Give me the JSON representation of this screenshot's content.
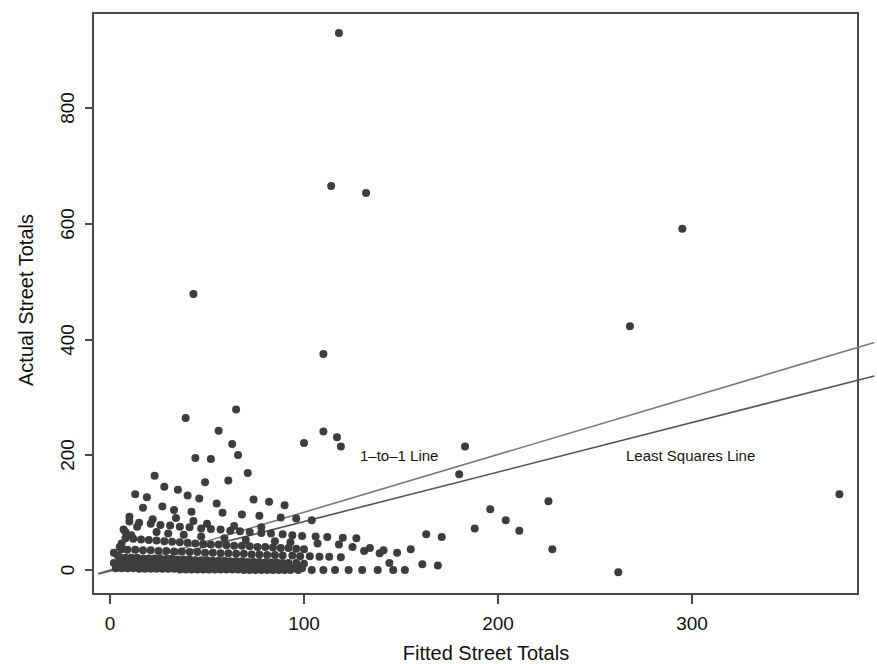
{
  "figure": {
    "title": "",
    "background_color": "#ffffff",
    "point_color": "#3d3d3d",
    "frame_color": "#4a4a4a"
  },
  "axes": {
    "x_title": "Fitted Street Totals",
    "y_title": "Actual Street Totals",
    "x_ticks": [
      "0",
      "100",
      "200",
      "300"
    ],
    "y_ticks": [
      "0",
      "200",
      "400",
      "600",
      "800"
    ]
  },
  "annotations": [
    {
      "id": "one-to-one",
      "label": "1–to–1 Line",
      "x_px": 360,
      "y_px": 461
    },
    {
      "id": "least-squares",
      "label": "Least Squares Line",
      "x_px": 626,
      "y_px": 461
    }
  ],
  "chart_data": {
    "type": "scatter",
    "title": "",
    "xlabel": "Fitted Street Totals",
    "ylabel": "Actual Street Totals",
    "xlim": [
      -7,
      395
    ],
    "ylim": [
      -40,
      975
    ],
    "x_ticks": [
      0,
      100,
      200,
      300
    ],
    "y_ticks": [
      0,
      200,
      400,
      600,
      800
    ],
    "grid": false,
    "legend": "none",
    "marker_color": "#3d3d3d",
    "marker_size_px": 8,
    "series": [
      {
        "name": "Streets",
        "type": "scatter",
        "points": [
          [
            118,
            930
          ],
          [
            114,
            665
          ],
          [
            132,
            653
          ],
          [
            295,
            591
          ],
          [
            43,
            478
          ],
          [
            268,
            422
          ],
          [
            110,
            374
          ],
          [
            65,
            278
          ],
          [
            39,
            263
          ],
          [
            110,
            240
          ],
          [
            100,
            220
          ],
          [
            117,
            230
          ],
          [
            56,
            241
          ],
          [
            63,
            218
          ],
          [
            119,
            214
          ],
          [
            44,
            194
          ],
          [
            52,
            192
          ],
          [
            66,
            199
          ],
          [
            180,
            166
          ],
          [
            376,
            131
          ],
          [
            71,
            168
          ],
          [
            23,
            163
          ],
          [
            61,
            155
          ],
          [
            49,
            152
          ],
          [
            183,
            214
          ],
          [
            196,
            105
          ],
          [
            204,
            86
          ],
          [
            226,
            119
          ],
          [
            28,
            144
          ],
          [
            35,
            139
          ],
          [
            13,
            131
          ],
          [
            40,
            129
          ],
          [
            19,
            126
          ],
          [
            46,
            124
          ],
          [
            74,
            122
          ],
          [
            82,
            118
          ],
          [
            90,
            112
          ],
          [
            55,
            115
          ],
          [
            27,
            110
          ],
          [
            17,
            108
          ],
          [
            33,
            104
          ],
          [
            42,
            101
          ],
          [
            58,
            99
          ],
          [
            68,
            96
          ],
          [
            77,
            94
          ],
          [
            88,
            91
          ],
          [
            96,
            89
          ],
          [
            104,
            86
          ],
          [
            10,
            84
          ],
          [
            15,
            82
          ],
          [
            21,
            80
          ],
          [
            26,
            78
          ],
          [
            31,
            77
          ],
          [
            36,
            75
          ],
          [
            41,
            74
          ],
          [
            47,
            72
          ],
          [
            52,
            71
          ],
          [
            57,
            70
          ],
          [
            62,
            68
          ],
          [
            67,
            67
          ],
          [
            72,
            66
          ],
          [
            78,
            64
          ],
          [
            83,
            63
          ],
          [
            89,
            62
          ],
          [
            94,
            60
          ],
          [
            99,
            59
          ],
          [
            106,
            58
          ],
          [
            112,
            57
          ],
          [
            120,
            56
          ],
          [
            127,
            55
          ],
          [
            134,
            38
          ],
          [
            141,
            34
          ],
          [
            148,
            30
          ],
          [
            155,
            36
          ],
          [
            163,
            62
          ],
          [
            171,
            57
          ],
          [
            8,
            55
          ],
          [
            12,
            54
          ],
          [
            16,
            53
          ],
          [
            20,
            52
          ],
          [
            24,
            51
          ],
          [
            28,
            50
          ],
          [
            32,
            49
          ],
          [
            36,
            48
          ],
          [
            40,
            47
          ],
          [
            44,
            46
          ],
          [
            48,
            45
          ],
          [
            52,
            44
          ],
          [
            56,
            44
          ],
          [
            60,
            43
          ],
          [
            64,
            42
          ],
          [
            68,
            42
          ],
          [
            72,
            41
          ],
          [
            76,
            40
          ],
          [
            80,
            40
          ],
          [
            84,
            39
          ],
          [
            88,
            38
          ],
          [
            92,
            38
          ],
          [
            96,
            37
          ],
          [
            100,
            36
          ],
          [
            6,
            36
          ],
          [
            9,
            35
          ],
          [
            13,
            35
          ],
          [
            17,
            34
          ],
          [
            21,
            34
          ],
          [
            25,
            33
          ],
          [
            29,
            33
          ],
          [
            33,
            32
          ],
          [
            37,
            32
          ],
          [
            41,
            31
          ],
          [
            45,
            31
          ],
          [
            49,
            30
          ],
          [
            53,
            30
          ],
          [
            57,
            29
          ],
          [
            61,
            29
          ],
          [
            65,
            28
          ],
          [
            69,
            28
          ],
          [
            73,
            27
          ],
          [
            77,
            27
          ],
          [
            81,
            26
          ],
          [
            85,
            26
          ],
          [
            89,
            25
          ],
          [
            94,
            25
          ],
          [
            98,
            24
          ],
          [
            103,
            24
          ],
          [
            108,
            23
          ],
          [
            113,
            23
          ],
          [
            119,
            22
          ],
          [
            5,
            22
          ],
          [
            8,
            21
          ],
          [
            11,
            21
          ],
          [
            14,
            21
          ],
          [
            17,
            20
          ],
          [
            20,
            20
          ],
          [
            23,
            20
          ],
          [
            26,
            19
          ],
          [
            29,
            19
          ],
          [
            32,
            19
          ],
          [
            35,
            18
          ],
          [
            38,
            18
          ],
          [
            41,
            18
          ],
          [
            44,
            17
          ],
          [
            47,
            17
          ],
          [
            50,
            17
          ],
          [
            53,
            16
          ],
          [
            56,
            16
          ],
          [
            59,
            16
          ],
          [
            62,
            15
          ],
          [
            65,
            15
          ],
          [
            68,
            15
          ],
          [
            71,
            14
          ],
          [
            74,
            14
          ],
          [
            77,
            14
          ],
          [
            80,
            13
          ],
          [
            83,
            13
          ],
          [
            86,
            13
          ],
          [
            89,
            12
          ],
          [
            92,
            12
          ],
          [
            96,
            12
          ],
          [
            100,
            11
          ],
          [
            4,
            11
          ],
          [
            7,
            11
          ],
          [
            10,
            10
          ],
          [
            13,
            10
          ],
          [
            16,
            10
          ],
          [
            19,
            10
          ],
          [
            22,
            9
          ],
          [
            25,
            9
          ],
          [
            28,
            9
          ],
          [
            31,
            9
          ],
          [
            34,
            8
          ],
          [
            37,
            8
          ],
          [
            40,
            8
          ],
          [
            43,
            8
          ],
          [
            46,
            7
          ],
          [
            49,
            7
          ],
          [
            52,
            7
          ],
          [
            55,
            7
          ],
          [
            58,
            6
          ],
          [
            61,
            6
          ],
          [
            64,
            6
          ],
          [
            67,
            6
          ],
          [
            70,
            5
          ],
          [
            73,
            5
          ],
          [
            76,
            5
          ],
          [
            79,
            5
          ],
          [
            82,
            4
          ],
          [
            85,
            4
          ],
          [
            88,
            4
          ],
          [
            91,
            4
          ],
          [
            95,
            3
          ],
          [
            99,
            3
          ],
          [
            3,
            3
          ],
          [
            6,
            3
          ],
          [
            9,
            3
          ],
          [
            12,
            3
          ],
          [
            15,
            2
          ],
          [
            18,
            2
          ],
          [
            21,
            2
          ],
          [
            24,
            2
          ],
          [
            27,
            2
          ],
          [
            30,
            2
          ],
          [
            33,
            2
          ],
          [
            36,
            1
          ],
          [
            39,
            1
          ],
          [
            42,
            1
          ],
          [
            45,
            1
          ],
          [
            48,
            1
          ],
          [
            51,
            1
          ],
          [
            54,
            1
          ],
          [
            57,
            1
          ],
          [
            60,
            1
          ],
          [
            63,
            1
          ],
          [
            66,
            1
          ],
          [
            69,
            0
          ],
          [
            72,
            0
          ],
          [
            75,
            0
          ],
          [
            78,
            0
          ],
          [
            81,
            0
          ],
          [
            84,
            0
          ],
          [
            87,
            0
          ],
          [
            90,
            0
          ],
          [
            93,
            0
          ],
          [
            97,
            0
          ],
          [
            104,
            0
          ],
          [
            110,
            0
          ],
          [
            116,
            0
          ],
          [
            123,
            0
          ],
          [
            130,
            0
          ],
          [
            138,
            0
          ],
          [
            146,
            0
          ],
          [
            152,
            0
          ],
          [
            2,
            30
          ],
          [
            5,
            40
          ],
          [
            11,
            60
          ],
          [
            24,
            66
          ],
          [
            30,
            63
          ],
          [
            38,
            61
          ],
          [
            47,
            58
          ],
          [
            59,
            55
          ],
          [
            70,
            52
          ],
          [
            85,
            50
          ],
          [
            93,
            48
          ],
          [
            107,
            46
          ],
          [
            7,
            70
          ],
          [
            14,
            75
          ],
          [
            22,
            88
          ],
          [
            34,
            90
          ],
          [
            43,
            85
          ],
          [
            50,
            80
          ],
          [
            64,
            76
          ],
          [
            78,
            74
          ],
          [
            2,
            12
          ],
          [
            4,
            25
          ],
          [
            6,
            46
          ],
          [
            8,
            66
          ],
          [
            10,
            92
          ],
          [
            118,
            44
          ],
          [
            125,
            40
          ],
          [
            131,
            33
          ],
          [
            139,
            29
          ],
          [
            144,
            12
          ],
          [
            161,
            10
          ],
          [
            169,
            8
          ],
          [
            188,
            72
          ],
          [
            211,
            68
          ],
          [
            228,
            36
          ],
          [
            262,
            -4
          ]
        ]
      }
    ],
    "lines": [
      {
        "name": "1-to-1 Line",
        "label": "1–to–1 Line",
        "color": "#7a7a7a",
        "slope": 1.0,
        "intercept": 0,
        "x_start": -6,
        "x_end": 394,
        "y_start": -6,
        "y_end": 394
      },
      {
        "name": "Least Squares Line",
        "label": "Least Squares Line",
        "color": "#555555",
        "slope": 0.858,
        "intercept": -2,
        "x_start": -6,
        "x_end": 394,
        "y_start": -7,
        "y_end": 336
      }
    ]
  }
}
